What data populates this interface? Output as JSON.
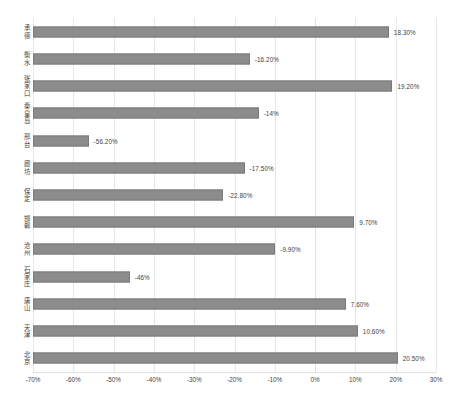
{
  "chart_data": {
    "type": "bar",
    "orientation": "horizontal",
    "title": "",
    "subtitle": "",
    "xlabel": "",
    "ylabel": "",
    "xlim": [
      -70,
      30
    ],
    "xtick_step": 10,
    "grid": true,
    "legend": false,
    "bar_origin_percent": -70,
    "categories": [
      "承德",
      "衡水",
      "张家口",
      "秦皇岛",
      "邢台",
      "廊坊",
      "保定",
      "邯郸",
      "沧州",
      "石家庄",
      "唐山",
      "天津",
      "北京"
    ],
    "values": [
      18.3,
      -16.2,
      19.2,
      -14.0,
      -56.2,
      -17.5,
      -22.8,
      9.7,
      -9.9,
      -46.0,
      7.6,
      10.6,
      20.5
    ],
    "data_labels": [
      "18.30%",
      "-16.20%",
      "19.20%",
      "-14%",
      "-56.20%",
      "-17.50%",
      "-22.80%",
      "9.70%",
      "-9.90%",
      "-46%",
      "7.60%",
      "10.60%",
      "20.50%"
    ],
    "xtick_labels": [
      "-70%",
      "-60%",
      "-50%",
      "-40%",
      "-30%",
      "-20%",
      "-10%",
      "0%",
      "10%",
      "20%",
      "30%"
    ],
    "xtick_values": [
      -70,
      -60,
      -50,
      -40,
      -30,
      -20,
      -10,
      0,
      10,
      20,
      30
    ],
    "colors": {
      "bar_fill": "#8c8c8c",
      "bar_stroke": "#7a7a7a",
      "gridline": "#e6e6e6",
      "text": "#3f3f3f",
      "background": "#ffffff"
    }
  }
}
